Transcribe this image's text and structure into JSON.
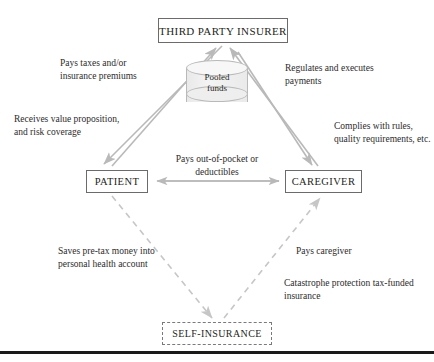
{
  "diagram": {
    "colors": {
      "solid_arrow": "#b9b9b9",
      "dashed_arrow": "#c6c6c6",
      "box_border": "#6b6b6b",
      "dashed_box_border": "#7a7a7a",
      "text": "#231f20",
      "cylinder_fill": "#eeeeee",
      "rule": "#1a1a1a"
    },
    "nodes": {
      "insurer": "THIRD PARTY INSURER",
      "patient": "PATIENT",
      "caregiver": "CAREGIVER",
      "self_insurance": "SELF-INSURANCE",
      "pooled_funds": "Pooled funds",
      "pooled_funds_line1": "Pooled",
      "pooled_funds_line2": "funds"
    },
    "labels": {
      "pays_taxes": "Pays taxes and/or insurance premiums",
      "receives_value": "Receives value proposition, and risk coverage",
      "regulates": "Regulates and executes payments",
      "complies": "Complies with rules, quality requirements, etc.",
      "out_of_pocket": "Pays out-of-pocket or deductibles",
      "saves_pretax": "Saves pre-tax money into personal health account",
      "pays_caregiver": "Pays caregiver",
      "catastrophe": "Catastrophe protection tax-funded insurance"
    },
    "edges": [
      {
        "from": "PATIENT",
        "to": "THIRD PARTY INSURER",
        "style": "solid",
        "label": "Pays taxes and/or insurance premiums"
      },
      {
        "from": "THIRD PARTY INSURER",
        "to": "PATIENT",
        "style": "solid",
        "label": "Receives value proposition, and risk coverage"
      },
      {
        "from": "CAREGIVER",
        "to": "THIRD PARTY INSURER",
        "style": "solid",
        "label": "Complies with rules, quality requirements, etc."
      },
      {
        "from": "THIRD PARTY INSURER",
        "to": "CAREGIVER",
        "style": "solid",
        "label": "Regulates and executes payments"
      },
      {
        "from": "PATIENT",
        "to": "CAREGIVER",
        "style": "solid",
        "bidirectional": true,
        "label": "Pays out-of-pocket or deductibles"
      },
      {
        "from": "PATIENT",
        "to": "SELF-INSURANCE",
        "style": "dashed",
        "label": "Saves pre-tax money into personal health account"
      },
      {
        "from": "SELF-INSURANCE",
        "to": "CAREGIVER",
        "style": "dashed",
        "label": "Pays caregiver"
      }
    ]
  }
}
